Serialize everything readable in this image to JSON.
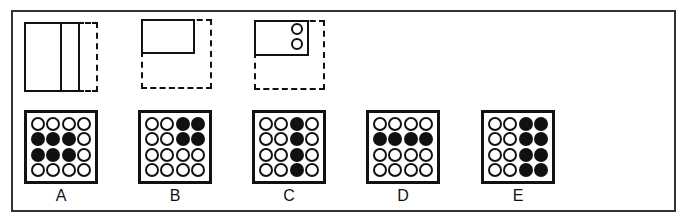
{
  "puzzle": {
    "sequence": [
      {
        "id": "fig-1",
        "description": "tall rectangle split by vertical line, dashed right extension"
      },
      {
        "id": "fig-2",
        "description": "small rectangle top-left inside dashed square"
      },
      {
        "id": "fig-3",
        "description": "small rectangle top-left with two stacked circles at right inside dashed square"
      }
    ],
    "options": [
      {
        "label": "A",
        "grid": [
          [
            0,
            0,
            0,
            0
          ],
          [
            1,
            1,
            1,
            0
          ],
          [
            1,
            1,
            1,
            0
          ],
          [
            0,
            0,
            0,
            0
          ]
        ]
      },
      {
        "label": "B",
        "grid": [
          [
            0,
            0,
            1,
            1
          ],
          [
            0,
            0,
            1,
            1
          ],
          [
            0,
            0,
            0,
            0
          ],
          [
            0,
            0,
            0,
            0
          ]
        ]
      },
      {
        "label": "C",
        "grid": [
          [
            0,
            0,
            1,
            0
          ],
          [
            0,
            0,
            1,
            0
          ],
          [
            0,
            0,
            1,
            0
          ],
          [
            0,
            0,
            1,
            0
          ]
        ]
      },
      {
        "label": "D",
        "grid": [
          [
            0,
            0,
            0,
            0
          ],
          [
            1,
            1,
            1,
            1
          ],
          [
            0,
            0,
            0,
            0
          ],
          [
            0,
            0,
            0,
            0
          ]
        ]
      },
      {
        "label": "E",
        "grid": [
          [
            0,
            0,
            1,
            1
          ],
          [
            0,
            0,
            1,
            1
          ],
          [
            0,
            0,
            1,
            1
          ],
          [
            0,
            0,
            1,
            1
          ]
        ]
      }
    ]
  },
  "colors": {
    "ink": "#111111",
    "frame": "#333333",
    "background": "#ffffff"
  }
}
